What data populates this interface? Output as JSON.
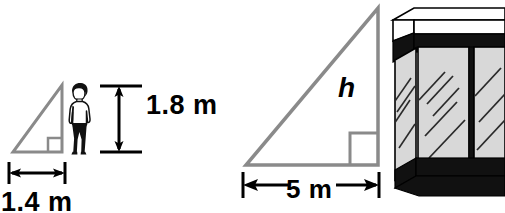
{
  "figure": {
    "colors": {
      "triangle_stroke": "#8a8a8a",
      "dimension_stroke": "#000000",
      "glass_fill": "#d8d8d8",
      "band_dark": "#111111",
      "outline": "#000000",
      "background": "#ffffff"
    }
  },
  "small_triangle": {
    "name": "person-shadow-triangle",
    "height_label": "1.8 m",
    "base_label": "1.4 m",
    "right_angle_marker": "square"
  },
  "large_triangle": {
    "name": "building-shadow-triangle",
    "height_label": "h",
    "base_label": "5 m",
    "right_angle_marker": "square"
  },
  "person": {
    "name": "person-silhouette",
    "description": "standing person"
  },
  "building": {
    "name": "glass-building-illustration",
    "description": "glass-walled building corner with dark bands"
  },
  "icons": {
    "vertical_double_arrow": "vertical-double-arrow-icon",
    "horizontal_double_arrow": "horizontal-double-arrow-icon"
  }
}
